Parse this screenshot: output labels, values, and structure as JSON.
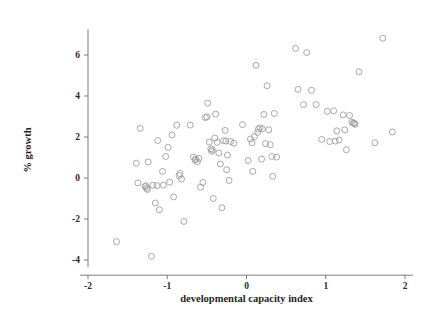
{
  "chart_data": {
    "type": "scatter",
    "title": "",
    "xlabel": "developmental capacity index",
    "ylabel": "% growth",
    "xlim": [
      -2.1,
      2.1
    ],
    "ylim": [
      -4.35,
      7.2
    ],
    "xticks": [
      -2,
      -1,
      0,
      1,
      2
    ],
    "xticklabels": [
      "-2",
      "-1",
      "0",
      "1",
      "2"
    ],
    "yticks": [
      6,
      4,
      2,
      0,
      -2,
      -4
    ],
    "yticklabels": [
      "6",
      "4",
      "2",
      "0",
      "-2",
      "-4"
    ],
    "grid": false,
    "legend": null,
    "marker": {
      "shape": "circle-open",
      "size": 3.0,
      "color": "#9a9a9a"
    },
    "points": [
      [
        -1.64,
        -3.1
      ],
      [
        -1.39,
        0.72
      ],
      [
        -1.37,
        -0.24
      ],
      [
        -1.34,
        2.42
      ],
      [
        -1.28,
        -0.42
      ],
      [
        -1.27,
        -0.38
      ],
      [
        -1.26,
        -0.5
      ],
      [
        -1.25,
        -0.56
      ],
      [
        -1.24,
        0.78
      ],
      [
        -1.2,
        -3.82
      ],
      [
        -1.18,
        -0.35
      ],
      [
        -1.15,
        -1.22
      ],
      [
        -1.13,
        -0.37
      ],
      [
        -1.12,
        1.83
      ],
      [
        -1.1,
        -1.55
      ],
      [
        -1.06,
        0.32
      ],
      [
        -1.05,
        -0.35
      ],
      [
        -1.02,
        1.05
      ],
      [
        -0.99,
        1.5
      ],
      [
        -0.97,
        -0.2
      ],
      [
        -0.94,
        2.1
      ],
      [
        -0.92,
        -0.92
      ],
      [
        -0.88,
        2.57
      ],
      [
        -0.85,
        0.12
      ],
      [
        -0.84,
        0.22
      ],
      [
        -0.82,
        -0.05
      ],
      [
        -0.79,
        -2.12
      ],
      [
        -0.71,
        2.58
      ],
      [
        -0.67,
        1.02
      ],
      [
        -0.65,
        0.88
      ],
      [
        -0.64,
        0.92
      ],
      [
        -0.62,
        0.8
      ],
      [
        -0.6,
        0.96
      ],
      [
        -0.58,
        -0.45
      ],
      [
        -0.55,
        -0.22
      ],
      [
        -0.52,
        2.95
      ],
      [
        -0.5,
        2.98
      ],
      [
        -0.49,
        3.65
      ],
      [
        -0.47,
        1.75
      ],
      [
        -0.45,
        1.42
      ],
      [
        -0.44,
        1.3
      ],
      [
        -0.43,
        1.38
      ],
      [
        -0.42,
        -1.0
      ],
      [
        -0.4,
        1.95
      ],
      [
        -0.39,
        3.12
      ],
      [
        -0.37,
        1.74
      ],
      [
        -0.35,
        1.22
      ],
      [
        -0.33,
        0.68
      ],
      [
        -0.31,
        -1.45
      ],
      [
        -0.29,
        1.82
      ],
      [
        -0.27,
        2.32
      ],
      [
        -0.26,
        1.8
      ],
      [
        -0.25,
        0.4
      ],
      [
        -0.24,
        1.12
      ],
      [
        -0.22,
        -0.12
      ],
      [
        -0.2,
        1.78
      ],
      [
        -0.16,
        1.7
      ],
      [
        -0.05,
        2.6
      ],
      [
        0.02,
        0.85
      ],
      [
        0.05,
        1.9
      ],
      [
        0.07,
        1.72
      ],
      [
        0.08,
        0.32
      ],
      [
        0.1,
        2.02
      ],
      [
        0.12,
        5.5
      ],
      [
        0.14,
        2.22
      ],
      [
        0.15,
        2.38
      ],
      [
        0.17,
        2.45
      ],
      [
        0.19,
        0.92
      ],
      [
        0.2,
        2.4
      ],
      [
        0.22,
        3.1
      ],
      [
        0.24,
        1.68
      ],
      [
        0.26,
        4.5
      ],
      [
        0.28,
        2.35
      ],
      [
        0.3,
        1.62
      ],
      [
        0.32,
        1.05
      ],
      [
        0.33,
        0.08
      ],
      [
        0.35,
        3.15
      ],
      [
        0.38,
        1.02
      ],
      [
        0.62,
        6.32
      ],
      [
        0.65,
        4.32
      ],
      [
        0.72,
        3.58
      ],
      [
        0.76,
        6.12
      ],
      [
        0.82,
        4.28
      ],
      [
        0.88,
        3.58
      ],
      [
        0.95,
        1.88
      ],
      [
        1.02,
        3.25
      ],
      [
        1.05,
        1.78
      ],
      [
        1.1,
        3.28
      ],
      [
        1.12,
        1.8
      ],
      [
        1.14,
        2.3
      ],
      [
        1.17,
        1.85
      ],
      [
        1.22,
        3.08
      ],
      [
        1.24,
        2.35
      ],
      [
        1.26,
        1.38
      ],
      [
        1.3,
        3.05
      ],
      [
        1.33,
        2.72
      ],
      [
        1.35,
        2.68
      ],
      [
        1.36,
        2.66
      ],
      [
        1.37,
        2.62
      ],
      [
        1.42,
        5.18
      ],
      [
        1.62,
        1.72
      ],
      [
        1.72,
        6.82
      ],
      [
        1.84,
        2.25
      ]
    ]
  }
}
